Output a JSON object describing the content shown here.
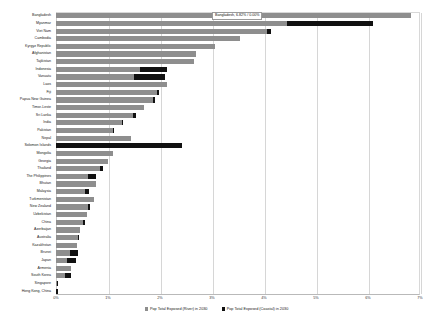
{
  "chart_data": {
    "type": "bar",
    "orientation": "horizontal",
    "stacked": true,
    "title": "",
    "xlabel": "",
    "ylabel": "",
    "xlim": [
      0,
      7
    ],
    "xticks": [
      "0%",
      "1%",
      "2%",
      "3%",
      "4%",
      "5%",
      "6%",
      "7%"
    ],
    "xtick_values": [
      0,
      1,
      2,
      3,
      4,
      5,
      6,
      7
    ],
    "grid": true,
    "legend_position": "bottom",
    "categories": [
      "Bangladesh",
      "Myanmar",
      "Viet Nam",
      "Cambodia",
      "Kyrgyz Republic",
      "Afghanistan",
      "Tajikistan",
      "Indonesia",
      "Vanuatu",
      "Laos",
      "Fiji",
      "Papua New Guinea",
      "Timor-Leste",
      "Sri Lanka",
      "India",
      "Pakistan",
      "Nepal",
      "Solomon Islands",
      "Mongolia",
      "Georgia",
      "Thailand",
      "The Philippines",
      "Bhutan",
      "Malaysia",
      "Turkmenistan",
      "New Zealand",
      "Uzbekistan",
      "China",
      "Azerbaijan",
      "Australia",
      "Kazakhstan",
      "Brunei",
      "Japan",
      "Armenia",
      "South Korea",
      "Singapore",
      "Hong Kong, China"
    ],
    "series": [
      {
        "name": "Pop Total Exposed (River) in 2030",
        "color": "#8e8e8e",
        "values": [
          6.82,
          4.45,
          4.06,
          3.54,
          3.05,
          2.7,
          2.66,
          1.62,
          1.5,
          2.14,
          1.94,
          1.86,
          1.7,
          1.48,
          1.26,
          1.1,
          1.44,
          0.0,
          1.1,
          1.0,
          0.84,
          0.62,
          0.76,
          0.56,
          0.74,
          0.62,
          0.6,
          0.52,
          0.46,
          0.42,
          0.4,
          0.26,
          0.22,
          0.28,
          0.18,
          0.02,
          0.0
        ]
      },
      {
        "name": "Pop Total Exposed (Coastal) in 2030",
        "color": "#111111",
        "values": [
          0.0,
          1.64,
          0.08,
          0.0,
          0.0,
          0.0,
          0.0,
          0.52,
          0.6,
          0.0,
          0.04,
          0.04,
          0.0,
          0.06,
          0.02,
          0.02,
          0.0,
          2.42,
          0.0,
          0.0,
          0.06,
          0.14,
          0.0,
          0.08,
          0.0,
          0.04,
          0.0,
          0.04,
          0.0,
          0.02,
          0.0,
          0.16,
          0.16,
          0.0,
          0.1,
          0.02,
          0.04
        ]
      }
    ],
    "annotation": {
      "text": "Bangladesh, 6.82% / 0.00%",
      "target_category": "Bangladesh"
    }
  },
  "legend": {
    "items": [
      {
        "label": "Pop Total Exposed (River) in 2030"
      },
      {
        "label": "Pop Total Exposed (Coastal) in 2030"
      }
    ]
  }
}
